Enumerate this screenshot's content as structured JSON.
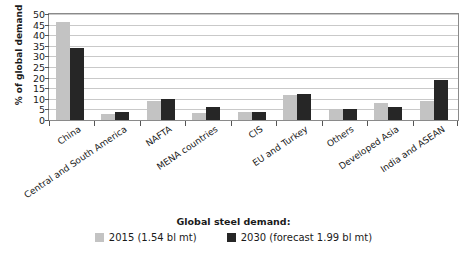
{
  "chart_data": {
    "type": "bar",
    "title": "",
    "xlabel": "",
    "ylabel": "% of global demand",
    "ylim": [
      0,
      50
    ],
    "yticks": [
      0,
      5,
      10,
      15,
      20,
      25,
      30,
      35,
      40,
      45,
      50
    ],
    "grid": true,
    "legend_position": "bottom",
    "legend_title": "Global steel demand:",
    "categories": [
      "China",
      "Central and South America",
      "NAFTA",
      "MENA countries",
      "CIS",
      "EU and Turkey",
      "Others",
      "Developed Asia",
      "India and ASEAN"
    ],
    "series": [
      {
        "name": "2015 (1.54 bl mt)",
        "color": "#c3c3c3",
        "values": [
          46,
          3,
          9,
          3.5,
          4,
          12,
          5,
          8,
          9
        ]
      },
      {
        "name": "2030 (forecast 1.99 bl mt)",
        "color": "#262626",
        "values": [
          34,
          4,
          10,
          6,
          4,
          12.5,
          5,
          6,
          19
        ]
      }
    ]
  },
  "colors": {
    "series_2015": "#c3c3c3",
    "series_2030": "#262626",
    "gridline": "#c9c9c9",
    "axis": "#8a8a8a",
    "text": "#1a1a1a",
    "background": "#ffffff"
  }
}
